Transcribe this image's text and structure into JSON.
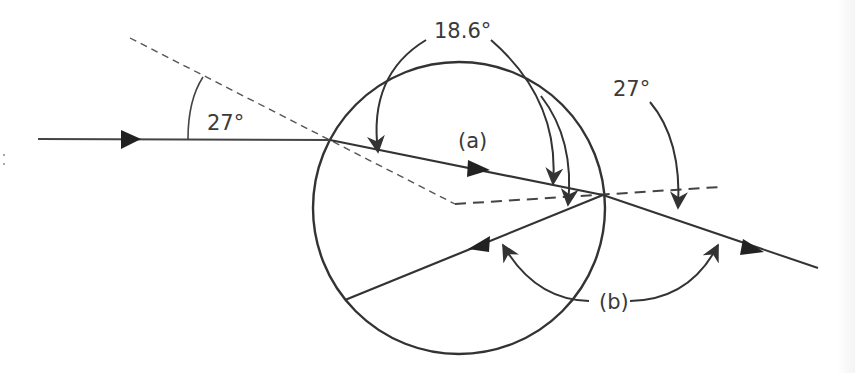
{
  "diagram": {
    "type": "light ray through a spherical water droplet (refraction and internal reflection)",
    "labels": {
      "incident_angle": "27°",
      "refracted_angle": "18.6°",
      "exit_angle": "27°",
      "ray_a": "(a)",
      "ray_b": "(b)"
    },
    "elements": {
      "droplet": {
        "shape": "circle",
        "center": [
          459,
          208
        ],
        "radius": 146
      },
      "incident_ray": {
        "from": [
          38,
          139
        ],
        "to": [
          330,
          140
        ]
      },
      "refracted_ray_a": {
        "from": [
          330,
          140
        ],
        "to": [
          603,
          195
        ]
      },
      "emergent_ray": {
        "from": [
          603,
          195
        ],
        "to": [
          818,
          268
        ]
      },
      "reflected_ray_b": {
        "from": [
          603,
          195
        ],
        "to": [
          345,
          300
        ]
      },
      "normal_entry_dashed": {
        "from": [
          130,
          38
        ],
        "to": [
          455,
          204
        ]
      },
      "normal_exit_dashed": {
        "from": [
          455,
          204
        ],
        "to": [
          720,
          187
        ]
      }
    },
    "colors": {
      "line": "#333333",
      "dashed": "#555555",
      "text": "#3a3a3a",
      "background": "#ffffff"
    }
  }
}
